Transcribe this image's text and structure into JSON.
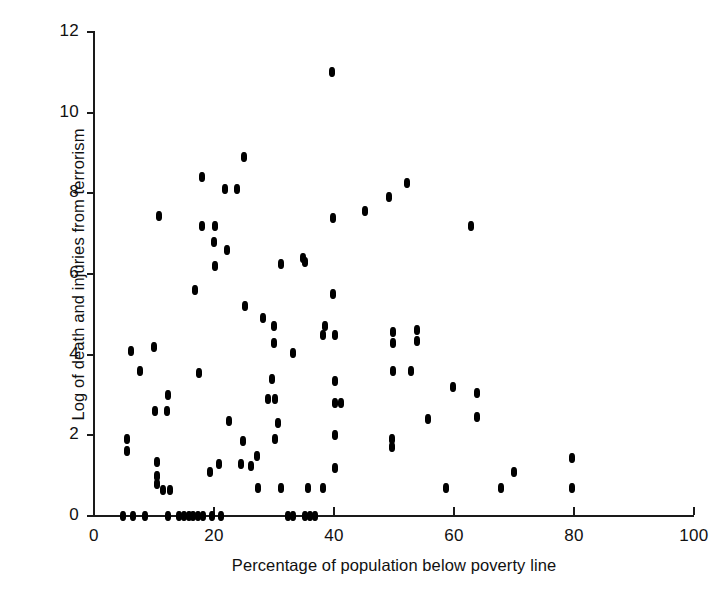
{
  "chart_data": {
    "type": "scatter",
    "title": "",
    "xlabel": "Percentage of population below poverty line",
    "ylabel": "Log of death and injuries from terrorism",
    "xlim": [
      0,
      100
    ],
    "ylim": [
      0,
      12
    ],
    "xticks": [
      0,
      20,
      40,
      60,
      80,
      100
    ],
    "yticks": [
      0,
      2,
      4,
      6,
      8,
      10,
      12
    ],
    "xticklabels": [
      "0",
      "20",
      "40",
      "60",
      "80",
      "100"
    ],
    "yticklabels": [
      "0",
      "2",
      "4",
      "6",
      "8",
      "10",
      "12"
    ],
    "grid": false,
    "legend": null,
    "marker": "filled-circle",
    "marker_color": "#000000",
    "series": [
      {
        "name": "countries",
        "points": [
          [
            4.8,
            0.0
          ],
          [
            6.5,
            0.0
          ],
          [
            8.5,
            0.0
          ],
          [
            12.4,
            0.0
          ],
          [
            14.2,
            0.0
          ],
          [
            15.0,
            0.0
          ],
          [
            15.8,
            0.0
          ],
          [
            16.5,
            0.0
          ],
          [
            17.3,
            0.0
          ],
          [
            18.2,
            0.0
          ],
          [
            19.7,
            0.0
          ],
          [
            21.2,
            0.0
          ],
          [
            32.3,
            0.0
          ],
          [
            33.1,
            0.0
          ],
          [
            35.2,
            0.0
          ],
          [
            36.0,
            0.0
          ],
          [
            36.8,
            0.0
          ],
          [
            5.5,
            1.6
          ],
          [
            5.5,
            1.9
          ],
          [
            6.2,
            4.1
          ],
          [
            7.7,
            3.6
          ],
          [
            10.0,
            4.2
          ],
          [
            10.2,
            2.6
          ],
          [
            10.5,
            0.8
          ],
          [
            10.5,
            1.0
          ],
          [
            10.5,
            1.35
          ],
          [
            10.8,
            7.45
          ],
          [
            11.5,
            0.65
          ],
          [
            12.2,
            2.6
          ],
          [
            12.4,
            3.0
          ],
          [
            12.7,
            0.65
          ],
          [
            16.9,
            5.6
          ],
          [
            17.5,
            3.55
          ],
          [
            18.0,
            7.2
          ],
          [
            18.0,
            8.4
          ],
          [
            19.4,
            1.1
          ],
          [
            20.0,
            6.8
          ],
          [
            20.2,
            6.2
          ],
          [
            20.2,
            7.2
          ],
          [
            20.9,
            1.3
          ],
          [
            21.9,
            8.1
          ],
          [
            22.2,
            6.6
          ],
          [
            22.5,
            2.35
          ],
          [
            23.9,
            8.1
          ],
          [
            24.5,
            1.3
          ],
          [
            24.9,
            1.85
          ],
          [
            25.0,
            8.9
          ],
          [
            25.2,
            5.2
          ],
          [
            26.2,
            1.25
          ],
          [
            27.2,
            1.5
          ],
          [
            27.4,
            0.7
          ],
          [
            28.2,
            4.9
          ],
          [
            29.0,
            2.9
          ],
          [
            29.6,
            3.4
          ],
          [
            30.0,
            4.3
          ],
          [
            30.0,
            4.7
          ],
          [
            30.2,
            1.9
          ],
          [
            30.2,
            2.9
          ],
          [
            30.7,
            2.3
          ],
          [
            31.1,
            0.7
          ],
          [
            31.2,
            6.25
          ],
          [
            33.1,
            4.05
          ],
          [
            34.9,
            6.4
          ],
          [
            35.2,
            6.3
          ],
          [
            35.6,
            0.7
          ],
          [
            38.1,
            4.5
          ],
          [
            38.2,
            0.7
          ],
          [
            38.5,
            4.7
          ],
          [
            39.7,
            11.0
          ],
          [
            39.9,
            5.5
          ],
          [
            39.9,
            7.4
          ],
          [
            40.1,
            1.2
          ],
          [
            40.1,
            2.0
          ],
          [
            40.1,
            2.8
          ],
          [
            40.1,
            3.35
          ],
          [
            40.1,
            4.5
          ],
          [
            41.2,
            2.8
          ],
          [
            45.1,
            7.55
          ],
          [
            49.1,
            7.9
          ],
          [
            49.7,
            1.7
          ],
          [
            49.7,
            1.9
          ],
          [
            49.9,
            3.6
          ],
          [
            49.9,
            4.3
          ],
          [
            49.9,
            4.55
          ],
          [
            52.2,
            8.25
          ],
          [
            52.8,
            3.6
          ],
          [
            53.9,
            4.35
          ],
          [
            53.9,
            4.6
          ],
          [
            55.7,
            2.4
          ],
          [
            58.6,
            0.7
          ],
          [
            59.9,
            3.2
          ],
          [
            62.8,
            7.2
          ],
          [
            63.9,
            2.45
          ],
          [
            63.9,
            3.05
          ],
          [
            67.8,
            0.7
          ],
          [
            70.0,
            1.1
          ],
          [
            79.7,
            0.7
          ],
          [
            79.7,
            1.45
          ]
        ]
      }
    ]
  },
  "figure": {
    "background_color": "#ffffff",
    "axis_color": "#1a1a1a"
  }
}
